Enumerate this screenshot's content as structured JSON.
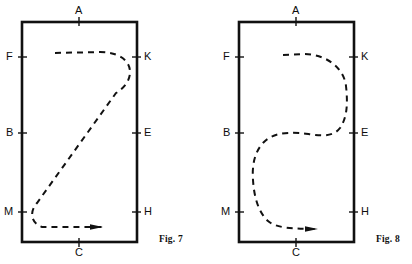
{
  "page": {
    "width": 412,
    "height": 264,
    "background": "#ffffff",
    "ink": "#111111"
  },
  "figures": [
    {
      "id": "fig7",
      "caption": "Fig. 7",
      "caption_pos": {
        "x": 159,
        "y": 234
      },
      "frame": {
        "x": 22,
        "y": 22,
        "w": 115,
        "h": 220
      },
      "path_shape": "z-curve",
      "arrow": {
        "x": 92,
        "y": 228,
        "direction": "right"
      },
      "labels": [
        {
          "text": "A",
          "side": "top",
          "x": 79,
          "y": 11,
          "tick": true
        },
        {
          "text": "C",
          "side": "bottom",
          "x": 79,
          "y": 253,
          "tick": true
        },
        {
          "text": "F",
          "side": "left",
          "x": 11,
          "y": 57,
          "tick": true
        },
        {
          "text": "B",
          "side": "left",
          "x": 11,
          "y": 133,
          "tick": true
        },
        {
          "text": "M",
          "side": "left",
          "x": 10,
          "y": 212,
          "tick": true
        },
        {
          "text": "K",
          "side": "right",
          "x": 147,
          "y": 57,
          "tick": true
        },
        {
          "text": "E",
          "side": "right",
          "x": 147,
          "y": 133,
          "tick": true
        },
        {
          "text": "H",
          "side": "right",
          "x": 147,
          "y": 212,
          "tick": true
        }
      ]
    },
    {
      "id": "fig8",
      "caption": "Fig. 8",
      "caption_pos": {
        "x": 376,
        "y": 234
      },
      "frame": {
        "x": 239,
        "y": 22,
        "w": 115,
        "h": 220
      },
      "path_shape": "s-curve",
      "arrow": {
        "x": 312,
        "y": 229,
        "direction": "right"
      },
      "labels": [
        {
          "text": "A",
          "side": "top",
          "x": 296,
          "y": 11,
          "tick": true
        },
        {
          "text": "C",
          "side": "bottom",
          "x": 296,
          "y": 253,
          "tick": true
        },
        {
          "text": "F",
          "side": "left",
          "x": 228,
          "y": 57,
          "tick": true
        },
        {
          "text": "B",
          "side": "left",
          "x": 228,
          "y": 133,
          "tick": true
        },
        {
          "text": "M",
          "side": "left",
          "x": 227,
          "y": 212,
          "tick": true
        },
        {
          "text": "K",
          "side": "right",
          "x": 364,
          "y": 57,
          "tick": true
        },
        {
          "text": "E",
          "side": "right",
          "x": 364,
          "y": 133,
          "tick": true
        },
        {
          "text": "H",
          "side": "right",
          "x": 364,
          "y": 212,
          "tick": true
        }
      ]
    }
  ],
  "label_text": {
    "A": "A",
    "B": "B",
    "C": "C",
    "E": "E",
    "F": "F",
    "H": "H",
    "K": "K",
    "M": "M"
  }
}
